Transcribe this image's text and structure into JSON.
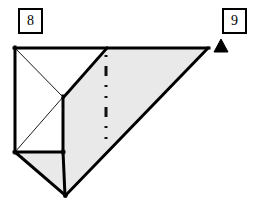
{
  "figure": {
    "type": "geometric-solid-diagram",
    "canvas": {
      "width": 253,
      "height": 206,
      "background": "#ffffff"
    },
    "labels": [
      {
        "id": "label-8",
        "text": "8",
        "box_x": 18,
        "box_y": 8,
        "box_w": 25,
        "box_h": 26
      },
      {
        "id": "label-9",
        "text": "9",
        "box_x": 222,
        "box_y": 8,
        "box_w": 25,
        "box_h": 26
      }
    ],
    "marker": {
      "name": "triangle-pointer",
      "shape": "filled-triangle",
      "color": "#000000",
      "points": "214,52 221,39 228,52"
    },
    "colors": {
      "outline": "#000000",
      "thin_line": "#1a1a1a",
      "face_shaded": "#e9e9e9",
      "face_shaded_dark": "#e2e2e2",
      "face_white": "#ffffff",
      "background": "#ffffff"
    },
    "vertices": {
      "top_left": "15,48",
      "top_mid": "107,48",
      "top_right": "208,48",
      "center": "63,97",
      "bottom_left": "15,152",
      "mid_left": "63,152",
      "bottom_apex": "65,196"
    },
    "faces": [
      {
        "name": "left-square-face",
        "fill": "#ffffff",
        "points": "15,48 63,48 63,152 15,152"
      },
      {
        "name": "top-slanted-band",
        "fill": "#e9e9e9",
        "points": "107,48 208,48 65,196 63,152 63,97"
      },
      {
        "name": "bottom-left-triangle",
        "fill": "#e9e9e9",
        "points": "15,152 63,152 65,196"
      }
    ],
    "edges": [
      {
        "name": "top-edge",
        "from": "15,48",
        "to": "208,48",
        "weight": "thick"
      },
      {
        "name": "left-vertical-edge",
        "from": "15,48",
        "to": "15,152",
        "weight": "thick"
      },
      {
        "name": "center-ridge-edge",
        "from": "63,97",
        "to": "107,48",
        "weight": "thick"
      },
      {
        "name": "center-vertical-edge",
        "from": "63,97",
        "to": "63,152",
        "weight": "thick"
      },
      {
        "name": "lower-front-edge",
        "from": "63,152",
        "to": "65,196",
        "weight": "thick"
      },
      {
        "name": "hypotenuse-edge",
        "from": "65,196",
        "to": "208,48",
        "weight": "thick"
      },
      {
        "name": "bottom-left-edge",
        "from": "15,152",
        "to": "65,196",
        "weight": "thick"
      },
      {
        "name": "mid-horizontal-edge",
        "from": "15,152",
        "to": "63,152",
        "weight": "thick"
      },
      {
        "name": "diagonal-top-left",
        "from": "15,48",
        "to": "63,97",
        "weight": "thin"
      },
      {
        "name": "diagonal-bottom-left",
        "from": "15,152",
        "to": "63,97",
        "weight": "thin"
      }
    ],
    "hidden_line": {
      "name": "hidden-axis-dash-dot",
      "style": "dash-dot-dot",
      "x": 106,
      "y_start": 55,
      "y_end": 147,
      "color": "#111111"
    }
  }
}
